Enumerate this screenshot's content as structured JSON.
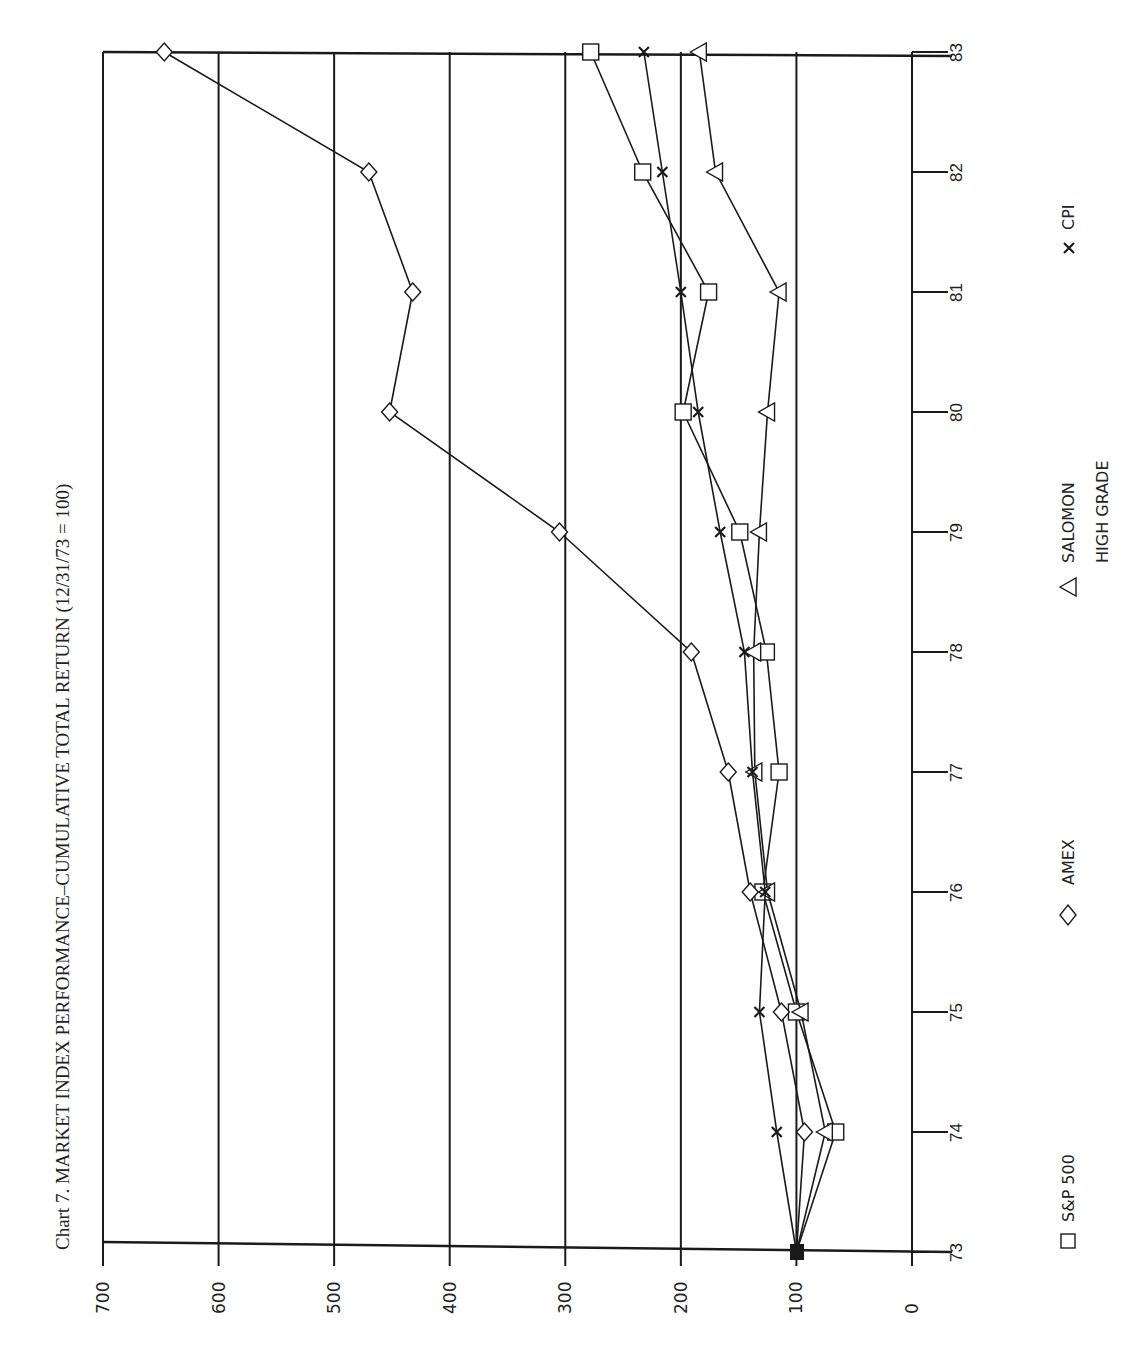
{
  "chart_data": {
    "type": "line",
    "title": "Chart 7.   MARKET INDEX PERFORMANCE–CUMULATIVE TOTAL RETURN (12/31/73 = 100)",
    "orientation": "rotated-90 (value axis horizontal, time axis vertical)",
    "xlabel": "Year",
    "ylabel": "Cumulative Total Return (12/31/73 = 100)",
    "x": [
      "73",
      "74",
      "75",
      "76",
      "77",
      "78",
      "79",
      "80",
      "81",
      "82",
      "83"
    ],
    "value_ticks": [
      "700",
      "600",
      "500",
      "400",
      "300",
      "200",
      "100",
      "0"
    ],
    "ylim": [
      0,
      700
    ],
    "grid": true,
    "legend_position": "bottom (rotated, right side of page)",
    "series": [
      {
        "name": "S&P 500",
        "marker": "square",
        "values": [
          100,
          66,
          100,
          129,
          115,
          126,
          149,
          198,
          176,
          233,
          278
        ]
      },
      {
        "name": "AMEX",
        "marker": "diamond",
        "values": [
          100,
          93,
          113,
          140,
          159,
          191,
          305,
          452,
          432,
          470,
          647
        ]
      },
      {
        "name": "SALOMON HIGH GRADE",
        "marker": "triangle",
        "values": [
          100,
          75,
          96,
          125,
          136,
          137,
          132,
          125,
          115,
          170,
          184
        ]
      },
      {
        "name": "CPI",
        "marker": "x",
        "values": [
          100,
          117,
          132,
          127,
          138,
          145,
          166,
          185,
          200,
          216,
          232
        ]
      }
    ]
  },
  "legend": {
    "items": [
      {
        "symbol": "□",
        "label": "S&P 500"
      },
      {
        "symbol": "◇",
        "label": "AMEX"
      },
      {
        "symbol": "△",
        "label_line1": "SALOMON",
        "label_line2": "HIGH GRADE"
      },
      {
        "symbol": "×",
        "label": "CPI"
      }
    ]
  }
}
